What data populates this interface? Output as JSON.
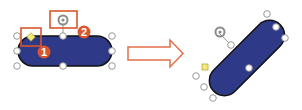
{
  "colors": {
    "shape_fill": "#2e3a87",
    "shape_stroke": "#111111",
    "handle_fill": "#ffffff",
    "handle_stroke": "#9a9a9a",
    "adjust_handle_fill": "#f4e97a",
    "rotate_handle": "#8a8a8a",
    "highlight_box": "#d9562e",
    "badge_fill": "#d9562e",
    "arrow_stroke": "#e0704a"
  },
  "before": {
    "label": "Selected rounded rectangle with adjustment and rotation handles",
    "callouts": [
      {
        "number": "1",
        "target": "adjustment-handle"
      },
      {
        "number": "2",
        "target": "rotation-handle"
      }
    ]
  },
  "transition": {
    "icon": "right-arrow-icon"
  },
  "after": {
    "label": "Rotated rounded rectangle"
  }
}
